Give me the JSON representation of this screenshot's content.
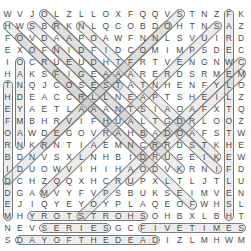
{
  "puzzle": {
    "rows": 20,
    "cols": 20,
    "grid": [
      "WVJOLZLLOXFQQVSTNZFK",
      "HWSBRKNLQCOBDOHTNSAZ",
      "FOVDAAPOAWFNNLSVUIRD",
      "EXOFNIDFIDCOMIMPSDEC",
      "IOCRUEUDHTFRTVENGNWC",
      "HAKSFIGEAAARERDSRMEM",
      "TNQJCOSESTATNHENFYLO",
      "HDEACCRLLNEAPTSHEILZ",
      "EYAETLAAANTSIAOAFXTQ",
      "FMBHRVIFHUALTGDRLOOZ",
      "OAWDEGOVRAHBADOAFSTW",
      "RNKRNTIAEMNCRRDSTKHE",
      "BDNVSXLNHBIDRUGEIKEW",
      "IDUOWVIHIHAODVKRNIFD",
      "DCHZQQXHCRUPXLTLJTLU",
      "DGAMVYFVPSBUKSEIMVEN",
      "EJIQYEYOYPLAQEOFWHSL",
      "MHYROTSTROHSOHBXLBHT",
      "NEVSERIESGCFIVETIMES",
      "SDAYOFTHEDEADIZLMHWM"
    ],
    "found_words": [
      {
        "word": "THEFORBIDDEN",
        "start": [
          6,
          0
        ],
        "end": [
          17,
          0
        ]
      },
      {
        "word": "CANDYMAN",
        "start": [
          4,
          1
        ],
        "end": [
          11,
          1
        ]
      },
      {
        "word": "FAREWELLTOTHEFLESH",
        "start": [
          0,
          18
        ],
        "end": [
          17,
          18
        ]
      },
      {
        "word": "HORTSTORY",
        "start": [
          17,
          11
        ],
        "end": [
          17,
          2
        ]
      },
      {
        "word": "SERIES",
        "start": [
          18,
          3
        ],
        "end": [
          18,
          8
        ]
      },
      {
        "word": "FIVETIMES",
        "start": [
          18,
          11
        ],
        "end": [
          18,
          19
        ]
      },
      {
        "word": "DAYOFTHEDEAD",
        "start": [
          19,
          1
        ],
        "end": [
          19,
          12
        ]
      },
      {
        "word": "diag-1",
        "start": [
          0,
          3
        ],
        "end": [
          6,
          9
        ]
      },
      {
        "word": "diag-2",
        "start": [
          1,
          0
        ],
        "end": [
          9,
          8
        ]
      },
      {
        "word": "diag-3",
        "start": [
          1,
          2
        ],
        "end": [
          10,
          11
        ]
      },
      {
        "word": "diag-4",
        "start": [
          2,
          1
        ],
        "end": [
          12,
          11
        ]
      },
      {
        "word": "diag-5",
        "start": [
          1,
          4
        ],
        "end": [
          10,
          13
        ]
      },
      {
        "word": "diag-6",
        "start": [
          1,
          6
        ],
        "end": [
          12,
          17
        ]
      },
      {
        "word": "diag-7",
        "start": [
          3,
          4
        ],
        "end": [
          13,
          14
        ]
      },
      {
        "word": "diag-8",
        "start": [
          5,
          4
        ],
        "end": [
          16,
          15
        ]
      },
      {
        "word": "diag-9",
        "start": [
          0,
          14
        ],
        "end": [
          11,
          3
        ]
      },
      {
        "word": "diag-10",
        "start": [
          1,
          13
        ],
        "end": [
          14,
          0
        ]
      },
      {
        "word": "diag-11",
        "start": [
          1,
          17
        ],
        "end": [
          15,
          3
        ]
      },
      {
        "word": "diag-12",
        "start": [
          5,
          19
        ],
        "end": [
          14,
          10
        ]
      },
      {
        "word": "diag-13",
        "start": [
          9,
          14
        ],
        "end": [
          17,
          6
        ]
      },
      {
        "word": "diag-14",
        "start": [
          13,
          17
        ],
        "end": [
          10,
          14
        ]
      },
      {
        "word": "diag-15",
        "start": [
          4,
          19
        ],
        "end": [
          11,
          12
        ]
      }
    ]
  },
  "colors": {
    "letter": "#4a4a4a",
    "highlight_border": "#7a7a7a",
    "background": "#ffffff"
  }
}
